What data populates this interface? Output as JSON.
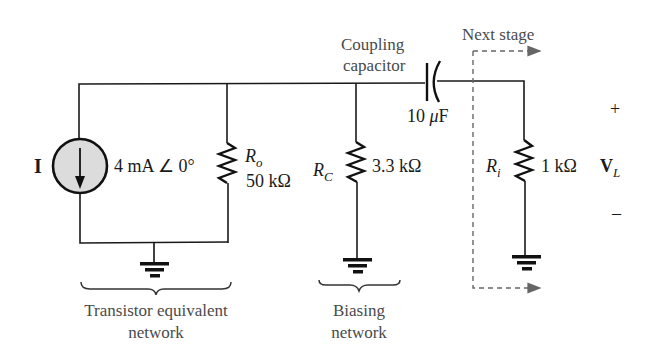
{
  "source": {
    "symbol": "I",
    "value": "4 mA ∠ 0°",
    "fill_color": "#dcdcdc"
  },
  "resistors": [
    {
      "name": "R",
      "sub": "o",
      "value": "50 kΩ"
    },
    {
      "name": "R",
      "sub": "C",
      "value": "3.3 kΩ"
    },
    {
      "name": "R",
      "sub": "i",
      "value": "1 kΩ"
    }
  ],
  "capacitor": {
    "label_line1": "Coupling",
    "label_line2": "capacitor",
    "value_num": "10 ",
    "value_mu": "μ",
    "value_unit": "F"
  },
  "next_stage": {
    "label": "Next stage"
  },
  "output": {
    "plus": "+",
    "minus": "–",
    "symbol": "V",
    "sub": "L"
  },
  "groups": [
    {
      "line1": "Transistor equivalent",
      "line2": "network"
    },
    {
      "line1": "Biasing",
      "line2": "network"
    }
  ]
}
